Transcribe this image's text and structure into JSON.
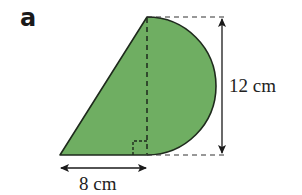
{
  "part_label": "a",
  "shape": {
    "description": "Right triangle joined to a semicircle along its vertical side",
    "fill_color": "#6fae62",
    "stroke_color": "#1e2a1c"
  },
  "dimensions": {
    "height_label": "12 cm",
    "base_label": "8 cm"
  },
  "markers": {
    "right_angle": true,
    "dashed_guides": true
  }
}
